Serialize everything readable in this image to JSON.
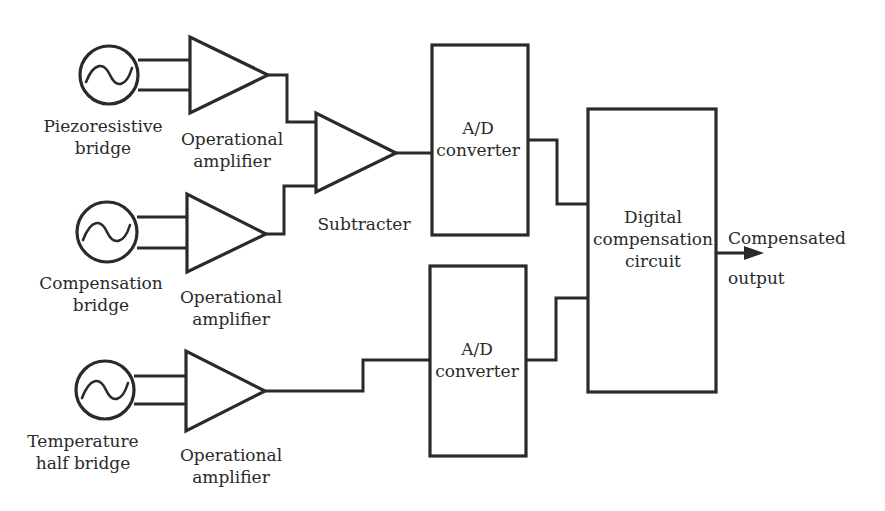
{
  "diagram": {
    "sources": [
      {
        "id": "piezoresistive-bridge",
        "label_line1": "Piezoresistive",
        "label_line2": "bridge"
      },
      {
        "id": "compensation-bridge",
        "label_line1": "Compensation",
        "label_line2": "bridge"
      },
      {
        "id": "temperature-half-bridge",
        "label_line1": "Temperature",
        "label_line2": "half bridge"
      }
    ],
    "amplifiers": [
      {
        "label_line1": "Operational",
        "label_line2": "amplifier"
      },
      {
        "label_line1": "Operational",
        "label_line2": "amplifier"
      },
      {
        "label_line1": "Operational",
        "label_line2": "amplifier"
      }
    ],
    "subtracter": {
      "label": "Subtracter"
    },
    "ad_converters": [
      {
        "label_line1": "A/D",
        "label_line2": "converter"
      },
      {
        "label_line1": "A/D",
        "label_line2": "converter"
      }
    ],
    "digital_compensation": {
      "label_line1": "Digital",
      "label_line2": "compensation",
      "label_line3": "circuit"
    },
    "output": {
      "label_line1": "Compensated",
      "label_line2": "output"
    },
    "colors": {
      "line": "#2a2a2a",
      "background": "#ffffff"
    }
  }
}
